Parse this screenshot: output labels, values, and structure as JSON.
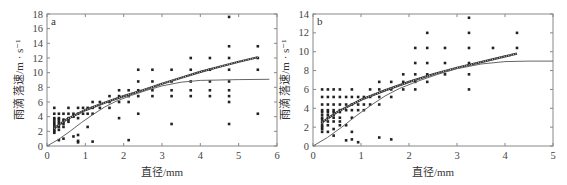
{
  "chart_data": [
    {
      "type": "scatter",
      "panel_label": "a",
      "title": "",
      "xlabel": "直径/mm",
      "ylabel": "雨滴 落速/m · s⁻¹",
      "xlim": [
        0,
        6
      ],
      "ylim": [
        0,
        18
      ],
      "xticks": [
        0,
        1,
        2,
        3,
        4,
        5,
        6
      ],
      "yticks": [
        0,
        2,
        4,
        6,
        8,
        10,
        12,
        14,
        16,
        18
      ],
      "grid": false,
      "series": [
        {
          "name": "observed",
          "kind": "scatter",
          "points": [
            [
              0.19,
              1.8
            ],
            [
              0.19,
              2.0
            ],
            [
              0.19,
              2.2
            ],
            [
              0.19,
              2.5
            ],
            [
              0.19,
              2.8
            ],
            [
              0.19,
              3.0
            ],
            [
              0.19,
              3.3
            ],
            [
              0.19,
              3.6
            ],
            [
              0.19,
              3.8
            ],
            [
              0.19,
              4.4
            ],
            [
              0.19,
              5.2
            ],
            [
              0.31,
              0.8
            ],
            [
              0.31,
              2.2
            ],
            [
              0.31,
              2.6
            ],
            [
              0.31,
              3.0
            ],
            [
              0.31,
              3.3
            ],
            [
              0.31,
              3.6
            ],
            [
              0.31,
              3.8
            ],
            [
              0.31,
              4.4
            ],
            [
              0.43,
              1.0
            ],
            [
              0.43,
              2.6
            ],
            [
              0.43,
              3.0
            ],
            [
              0.43,
              3.3
            ],
            [
              0.43,
              3.6
            ],
            [
              0.43,
              4.4
            ],
            [
              0.56,
              3.3
            ],
            [
              0.56,
              3.6
            ],
            [
              0.56,
              3.8
            ],
            [
              0.56,
              4.4
            ],
            [
              0.56,
              5.2
            ],
            [
              0.69,
              1.3
            ],
            [
              0.69,
              4.0
            ],
            [
              0.69,
              4.4
            ],
            [
              0.81,
              0.5
            ],
            [
              0.81,
              0.7
            ],
            [
              0.81,
              1.5
            ],
            [
              0.81,
              3.8
            ],
            [
              0.81,
              4.4
            ],
            [
              0.81,
              5.2
            ],
            [
              0.94,
              4.4
            ],
            [
              0.94,
              5.2
            ],
            [
              1.06,
              2.6
            ],
            [
              1.06,
              4.4
            ],
            [
              1.06,
              5.2
            ],
            [
              1.19,
              0.6
            ],
            [
              1.19,
              4.4
            ],
            [
              1.19,
              5.2
            ],
            [
              1.19,
              6.0
            ],
            [
              1.38,
              5.2
            ],
            [
              1.38,
              6.0
            ],
            [
              1.63,
              5.2
            ],
            [
              1.63,
              6.0
            ],
            [
              1.63,
              6.8
            ],
            [
              1.88,
              3.8
            ],
            [
              1.88,
              6.0
            ],
            [
              1.88,
              6.8
            ],
            [
              1.88,
              7.6
            ],
            [
              2.13,
              0.8
            ],
            [
              2.13,
              6.0
            ],
            [
              2.13,
              6.8
            ],
            [
              2.13,
              7.6
            ],
            [
              2.38,
              4.4
            ],
            [
              2.38,
              6.8
            ],
            [
              2.38,
              7.6
            ],
            [
              2.38,
              8.8
            ],
            [
              2.38,
              10.4
            ],
            [
              2.75,
              6.8
            ],
            [
              2.75,
              7.6
            ],
            [
              2.75,
              8.8
            ],
            [
              2.75,
              10.4
            ],
            [
              3.25,
              3.0
            ],
            [
              3.25,
              6.8
            ],
            [
              3.25,
              7.6
            ],
            [
              3.25,
              8.8
            ],
            [
              3.25,
              10.4
            ],
            [
              3.75,
              6.8
            ],
            [
              3.75,
              7.6
            ],
            [
              3.75,
              8.8
            ],
            [
              3.75,
              10.4
            ],
            [
              3.75,
              12.0
            ],
            [
              4.25,
              6.8
            ],
            [
              4.25,
              7.6
            ],
            [
              4.25,
              8.8
            ],
            [
              4.25,
              10.4
            ],
            [
              4.25,
              12.0
            ],
            [
              4.75,
              3.0
            ],
            [
              4.75,
              6.0
            ],
            [
              4.75,
              6.8
            ],
            [
              4.75,
              7.6
            ],
            [
              4.75,
              8.8
            ],
            [
              4.75,
              10.4
            ],
            [
              4.75,
              12.0
            ],
            [
              4.75,
              13.6
            ],
            [
              4.75,
              17.6
            ],
            [
              5.5,
              4.4
            ],
            [
              5.5,
              10.4
            ],
            [
              5.5,
              12.0
            ],
            [
              5.5,
              13.6
            ]
          ]
        },
        {
          "name": "fit",
          "kind": "line-dotted",
          "points": [
            [
              0.19,
              2.4
            ],
            [
              0.5,
              3.6
            ],
            [
              1.0,
              4.9
            ],
            [
              1.5,
              5.9
            ],
            [
              2.0,
              6.8
            ],
            [
              2.5,
              7.6
            ],
            [
              3.0,
              8.5
            ],
            [
              3.5,
              9.3
            ],
            [
              4.0,
              10.1
            ],
            [
              4.5,
              10.8
            ],
            [
              5.0,
              11.5
            ],
            [
              5.5,
              12.1
            ]
          ]
        },
        {
          "name": "empirical",
          "kind": "line",
          "points": [
            [
              0,
              0
            ],
            [
              0.3,
              0.9
            ],
            [
              0.6,
              2.0
            ],
            [
              0.9,
              3.2
            ],
            [
              1.2,
              4.3
            ],
            [
              1.5,
              5.3
            ],
            [
              1.8,
              6.1
            ],
            [
              2.2,
              6.9
            ],
            [
              2.6,
              7.6
            ],
            [
              3.0,
              8.2
            ],
            [
              3.5,
              8.7
            ],
            [
              4.0,
              8.95
            ],
            [
              4.5,
              9.0
            ],
            [
              5.0,
              9.05
            ],
            [
              5.8,
              9.1
            ]
          ]
        }
      ]
    },
    {
      "type": "scatter",
      "panel_label": "b",
      "title": "",
      "xlabel": "直径/mm",
      "ylabel": "雨滴 落速/m · s⁻¹",
      "xlim": [
        0,
        5
      ],
      "ylim": [
        0,
        14
      ],
      "xticks": [
        0,
        1,
        2,
        3,
        4,
        5
      ],
      "yticks": [
        0,
        2,
        4,
        6,
        8,
        10,
        12,
        14
      ],
      "grid": false,
      "series": [
        {
          "name": "observed",
          "kind": "scatter",
          "points": [
            [
              0.19,
              1.5
            ],
            [
              0.19,
              1.8
            ],
            [
              0.19,
              2.0
            ],
            [
              0.19,
              2.2
            ],
            [
              0.19,
              2.5
            ],
            [
              0.19,
              2.8
            ],
            [
              0.19,
              3.0
            ],
            [
              0.19,
              3.3
            ],
            [
              0.19,
              3.6
            ],
            [
              0.19,
              3.8
            ],
            [
              0.19,
              4.4
            ],
            [
              0.19,
              5.2
            ],
            [
              0.19,
              6.0
            ],
            [
              0.31,
              1.5
            ],
            [
              0.31,
              2.2
            ],
            [
              0.31,
              2.6
            ],
            [
              0.31,
              3.0
            ],
            [
              0.31,
              3.3
            ],
            [
              0.31,
              3.6
            ],
            [
              0.31,
              3.8
            ],
            [
              0.31,
              4.4
            ],
            [
              0.31,
              5.2
            ],
            [
              0.31,
              6.0
            ],
            [
              0.43,
              1.1
            ],
            [
              0.43,
              1.8
            ],
            [
              0.43,
              2.6
            ],
            [
              0.43,
              3.0
            ],
            [
              0.43,
              3.3
            ],
            [
              0.43,
              3.6
            ],
            [
              0.43,
              3.8
            ],
            [
              0.43,
              4.4
            ],
            [
              0.43,
              5.2
            ],
            [
              0.43,
              6.0
            ],
            [
              0.56,
              2.2
            ],
            [
              0.56,
              2.6
            ],
            [
              0.56,
              3.0
            ],
            [
              0.56,
              3.6
            ],
            [
              0.56,
              3.8
            ],
            [
              0.56,
              4.4
            ],
            [
              0.56,
              5.2
            ],
            [
              0.56,
              6.0
            ],
            [
              0.69,
              0.6
            ],
            [
              0.69,
              2.2
            ],
            [
              0.69,
              3.8
            ],
            [
              0.69,
              4.4
            ],
            [
              0.69,
              5.2
            ],
            [
              0.81,
              0.7
            ],
            [
              0.81,
              1.5
            ],
            [
              0.81,
              3.0
            ],
            [
              0.81,
              3.8
            ],
            [
              0.81,
              4.4
            ],
            [
              0.81,
              5.2
            ],
            [
              0.81,
              6.0
            ],
            [
              0.94,
              0.4
            ],
            [
              0.94,
              3.8
            ],
            [
              0.94,
              4.4
            ],
            [
              0.94,
              5.2
            ],
            [
              1.06,
              3.8
            ],
            [
              1.06,
              4.4
            ],
            [
              1.06,
              5.2
            ],
            [
              1.19,
              4.4
            ],
            [
              1.19,
              5.2
            ],
            [
              1.19,
              6.0
            ],
            [
              1.38,
              0.9
            ],
            [
              1.38,
              4.4
            ],
            [
              1.38,
              5.2
            ],
            [
              1.38,
              6.0
            ],
            [
              1.38,
              6.8
            ],
            [
              1.63,
              0.7
            ],
            [
              1.63,
              5.2
            ],
            [
              1.63,
              6.0
            ],
            [
              1.63,
              6.8
            ],
            [
              1.88,
              6.0
            ],
            [
              1.88,
              6.8
            ],
            [
              1.88,
              7.6
            ],
            [
              2.13,
              6.0
            ],
            [
              2.13,
              6.8
            ],
            [
              2.13,
              7.6
            ],
            [
              2.13,
              8.8
            ],
            [
              2.13,
              10.4
            ],
            [
              2.38,
              6.8
            ],
            [
              2.38,
              7.6
            ],
            [
              2.38,
              8.8
            ],
            [
              2.38,
              10.4
            ],
            [
              2.38,
              12.0
            ],
            [
              2.75,
              7.6
            ],
            [
              2.75,
              8.8
            ],
            [
              2.75,
              10.4
            ],
            [
              3.25,
              6.0
            ],
            [
              3.25,
              7.6
            ],
            [
              3.25,
              8.8
            ],
            [
              3.25,
              10.4
            ],
            [
              3.25,
              12.0
            ],
            [
              3.25,
              13.6
            ],
            [
              3.75,
              10.4
            ],
            [
              4.25,
              10.4
            ],
            [
              4.25,
              12.0
            ]
          ]
        },
        {
          "name": "fit",
          "kind": "line-dotted",
          "points": [
            [
              0.19,
              2.5
            ],
            [
              0.5,
              3.6
            ],
            [
              1.0,
              4.9
            ],
            [
              1.5,
              5.9
            ],
            [
              2.0,
              6.8
            ],
            [
              2.5,
              7.6
            ],
            [
              3.0,
              8.3
            ],
            [
              3.5,
              8.9
            ],
            [
              4.0,
              9.5
            ],
            [
              4.25,
              9.8
            ]
          ]
        },
        {
          "name": "empirical",
          "kind": "line",
          "points": [
            [
              0,
              0
            ],
            [
              0.3,
              0.9
            ],
            [
              0.6,
              2.0
            ],
            [
              0.9,
              3.2
            ],
            [
              1.2,
              4.3
            ],
            [
              1.5,
              5.3
            ],
            [
              1.8,
              6.1
            ],
            [
              2.2,
              6.9
            ],
            [
              2.6,
              7.6
            ],
            [
              3.0,
              8.2
            ],
            [
              3.5,
              8.7
            ],
            [
              4.0,
              8.95
            ],
            [
              4.5,
              9.0
            ],
            [
              5.0,
              9.0
            ]
          ]
        }
      ]
    }
  ]
}
